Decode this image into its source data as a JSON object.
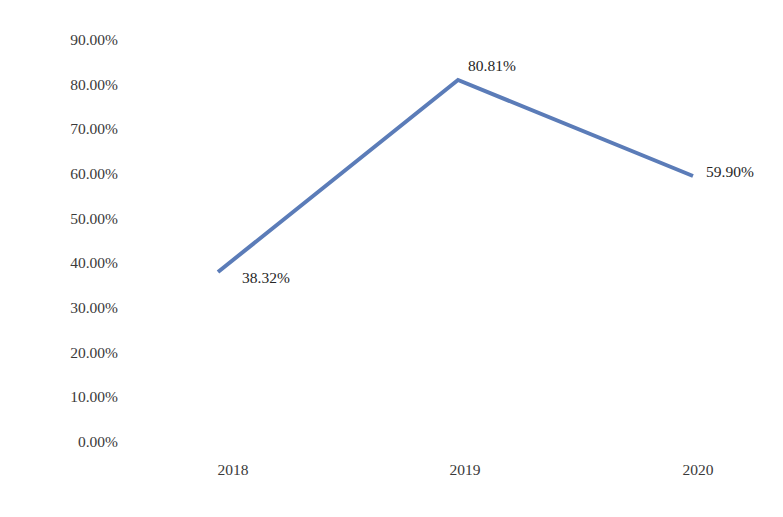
{
  "chart_data": {
    "type": "line",
    "title": "",
    "subtitle": "",
    "xlabel": "",
    "ylabel": "",
    "categories": [
      "2018",
      "2019",
      "2020"
    ],
    "values": [
      38.32,
      80.81,
      59.9
    ],
    "value_labels": [
      "38.32%",
      "80.81%",
      "59.90%"
    ],
    "ylim": [
      0,
      90
    ],
    "y_ticks": [
      0,
      10,
      20,
      30,
      40,
      50,
      60,
      70,
      80,
      90
    ],
    "y_tick_labels": [
      "90.00%",
      "80.00%",
      "70.00%",
      "60.00%",
      "50.00%",
      "40.00%",
      "30.00%",
      "20.00%",
      "10.00%",
      "0.00%"
    ],
    "series": [
      {
        "name": "",
        "values": [
          38.32,
          80.81,
          59.9
        ],
        "color": "#5b7cb8"
      }
    ],
    "grid": false,
    "legend": false,
    "legend_position": "none",
    "axis_lines": false,
    "markers": false,
    "line_width": 4,
    "colors": {
      "line": "#5b7cb8",
      "tick_text": "#3a3a3a",
      "label_text": "#262626",
      "background": "#ffffff"
    }
  },
  "y_axis": {
    "ticks": [
      {
        "label": "90.00%",
        "y": 40
      },
      {
        "label": "80.00%",
        "y": 84.7
      },
      {
        "label": "70.00%",
        "y": 129.3
      },
      {
        "label": "60.00%",
        "y": 174
      },
      {
        "label": "50.00%",
        "y": 218.7
      },
      {
        "label": "40.00%",
        "y": 263.3
      },
      {
        "label": "30.00%",
        "y": 308
      },
      {
        "label": "20.00%",
        "y": 352.7
      },
      {
        "label": "10.00%",
        "y": 397.3
      },
      {
        "label": "0.00%",
        "y": 442
      }
    ]
  },
  "x_axis": {
    "ticks": [
      {
        "label": "2018",
        "x": 233,
        "y": 470
      },
      {
        "label": "2019",
        "x": 465,
        "y": 470
      },
      {
        "label": "2020",
        "x": 698,
        "y": 470
      }
    ]
  },
  "data_labels": [
    {
      "text": "38.32%",
      "x": 242,
      "y": 278
    },
    {
      "text": "80.81%",
      "x": 468,
      "y": 66
    },
    {
      "text": "59.90%",
      "x": 706,
      "y": 172
    }
  ],
  "line_path": {
    "points": "218,272 458,80 693,176",
    "color": "#5b7cb8",
    "width": "4"
  }
}
